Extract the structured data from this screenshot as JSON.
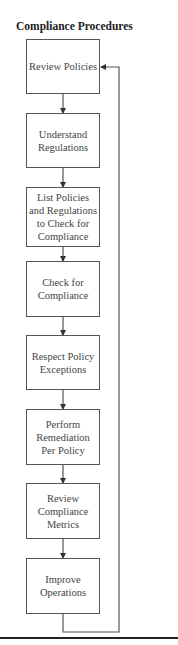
{
  "diagram": {
    "title": "Compliance Procedures",
    "steps": [
      {
        "label": "Review Policies"
      },
      {
        "label": "Understand Regulations"
      },
      {
        "label": "List Policies and Regulations to Check for Compliance"
      },
      {
        "label": "Check for Compliance"
      },
      {
        "label": "Respect Policy Exceptions"
      },
      {
        "label": "Perform Remediation Per Policy"
      },
      {
        "label": "Review Compliance Metrics"
      },
      {
        "label": "Improve Operations"
      }
    ],
    "flow": "sequential",
    "loop_back": {
      "from": "Improve Operations",
      "to": "Review Policies"
    }
  }
}
